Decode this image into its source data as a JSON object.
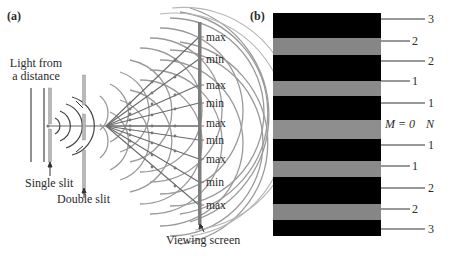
{
  "panel_a": {
    "label": "(a)",
    "source_label_line1": "Light from",
    "source_label_line2": "a distance",
    "single_slit_label": "Single slit",
    "double_slit_label": "Double slit",
    "screen_label": "Viewing screen",
    "screen_markers": [
      "max",
      "min",
      "max",
      "min",
      "max",
      "min",
      "max",
      "min",
      "max"
    ]
  },
  "panel_b": {
    "label": "(b)",
    "center_label_m": "M = 0",
    "center_label_n": "N",
    "boundary_labels": [
      "3",
      "2",
      "2",
      "1",
      "1",
      "1",
      "1",
      "2",
      "2",
      "3"
    ],
    "bright_band_color": "#8a8a8a",
    "dark_band_color": "#050505"
  }
}
